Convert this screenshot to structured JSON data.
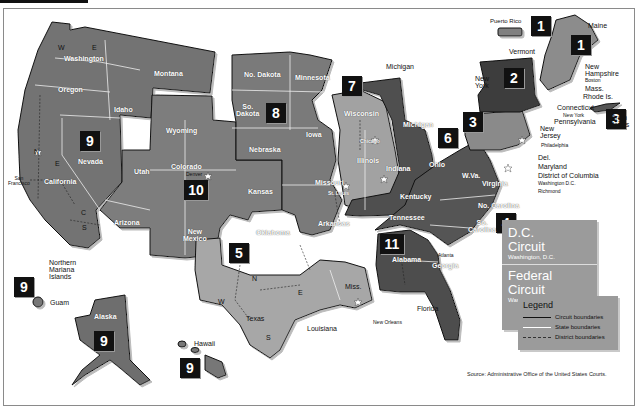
{
  "map": {
    "title": "Geographic Boundaries of United States Courts of Appeals and United States District Courts",
    "source": "Source: Administrative Office of the United States Courts.",
    "colors": {
      "circuit_dark": "#4a4a4a",
      "circuit_medium": "#767676",
      "circuit_light": "#a8a8a8",
      "boundary": "#111111",
      "badge_bg": "#111111",
      "badge_text": "#ffffff",
      "info_box": "#9b9b9b"
    },
    "circuits": [
      {
        "number": "1",
        "states": [
          "Maine",
          "New Hampshire",
          "Mass.",
          "Rhode Is.",
          "Puerto Rico"
        ]
      },
      {
        "number": "2",
        "states": [
          "Vermont",
          "New York",
          "Connecticut"
        ]
      },
      {
        "number": "3",
        "states": [
          "Pennsylvania",
          "New Jersey",
          "Del.",
          "Virgin Islands"
        ]
      },
      {
        "number": "4",
        "states": [
          "Maryland",
          "W.Va.",
          "Virginia",
          "No. Carolina",
          "So. Carolina"
        ]
      },
      {
        "number": "5",
        "states": [
          "Texas",
          "Louisiana",
          "Miss."
        ]
      },
      {
        "number": "6",
        "states": [
          "Michigan",
          "Ohio",
          "Kentucky",
          "Tennessee"
        ]
      },
      {
        "number": "7",
        "states": [
          "Wisconsin",
          "Illinois",
          "Indiana"
        ]
      },
      {
        "number": "8",
        "states": [
          "No. Dakota",
          "So. Dakota",
          "Minnesota",
          "Nebraska",
          "Iowa",
          "Missouri",
          "Arkansas"
        ]
      },
      {
        "number": "9",
        "states": [
          "Washington",
          "Oregon",
          "Idaho",
          "Montana",
          "Nevada",
          "California",
          "Arizona",
          "Alaska",
          "Hawaii",
          "Guam",
          "Northern Mariana Islands"
        ]
      },
      {
        "number": "10",
        "states": [
          "Wyoming",
          "Utah",
          "Colorado",
          "Kansas",
          "New Mexico",
          "Oklahoma"
        ]
      },
      {
        "number": "11",
        "states": [
          "Alabama",
          "Georgia",
          "Florida"
        ]
      }
    ],
    "badges": [
      {
        "id": "b1a",
        "label": "1"
      },
      {
        "id": "b1b",
        "label": "1"
      },
      {
        "id": "b2",
        "label": "2"
      },
      {
        "id": "b3a",
        "label": "3"
      },
      {
        "id": "b3b",
        "label": "3"
      },
      {
        "id": "b4",
        "label": "4"
      },
      {
        "id": "b5",
        "label": "5"
      },
      {
        "id": "b6",
        "label": "6"
      },
      {
        "id": "b7",
        "label": "7"
      },
      {
        "id": "b8",
        "label": "8"
      },
      {
        "id": "b9a",
        "label": "9"
      },
      {
        "id": "b9b",
        "label": "9"
      },
      {
        "id": "b9c",
        "label": "9"
      },
      {
        "id": "b9d",
        "label": "9"
      },
      {
        "id": "b10",
        "label": "10"
      },
      {
        "id": "b11",
        "label": "11"
      }
    ],
    "state_labels": {
      "washington": "Washington",
      "oregon": "Oregon",
      "idaho": "Idaho",
      "montana": "Montana",
      "wyoming": "Wyoming",
      "nevada": "Nevada",
      "california": "California",
      "utah": "Utah",
      "colorado": "Colorado",
      "arizona": "Arizona",
      "new_mexico": "New\nMexico",
      "kansas": "Kansas",
      "oklahoma": "Oklahoma",
      "texas": "Texas",
      "louisiana": "Louisiana",
      "miss": "Miss.",
      "no_dakota": "No. Dakota",
      "so_dakota": "So.\nDakota",
      "minnesota": "Minnesota",
      "nebraska": "Nebraska",
      "iowa": "Iowa",
      "missouri": "Missouri",
      "arkansas": "Arkansas",
      "wisconsin": "Wisconsin",
      "illinois": "Illinois",
      "indiana": "Indiana",
      "michigan": "Michigan",
      "michigan_up": "Michigan",
      "ohio": "Ohio",
      "kentucky": "Kentucky",
      "tennessee": "Tennessee",
      "alabama": "Alabama",
      "georgia": "Georgia",
      "florida": "Florida",
      "wva": "W.Va.",
      "virginia": "Virginia",
      "no_carolina": "No. Carolina",
      "so_carolina": "So.\nCarolina",
      "pennsylvania": "Pennsylvania",
      "new_jersey": "New\nJersey",
      "del": "Del.",
      "maryland": "Maryland",
      "dc": "District of Columbia",
      "new_york": "New\nYork",
      "vermont": "Vermont",
      "connecticut": "Connecticut",
      "maine": "Maine",
      "new_hampshire": "New\nHampshire",
      "mass": "Mass.",
      "rhode_is": "Rhode Is.",
      "puerto_rico": "Puerto Rico",
      "virgin_islands": "Virgin\nIslands",
      "alaska": "Alaska",
      "hawaii": "Hawaii",
      "guam": "Guam",
      "northern_mariana": "Northern\nMariana\nIslands"
    },
    "cities": {
      "san_francisco": "San\nFrancisco",
      "denver": "Denver",
      "st_louis": "St. Louis",
      "chicago": "Chicago",
      "new_orleans": "New Orleans",
      "atlanta": "Atlanta",
      "boston": "Boston",
      "new_york": "New York",
      "philadelphia": "Philadelphia",
      "washington_dc": "Washington D.C.",
      "richmond": "Richmond"
    },
    "district_markers": [
      "N",
      "S",
      "E",
      "W",
      "C",
      "M"
    ],
    "dc_circuit": {
      "title_line1": "D.C.",
      "title_line2": "Circuit",
      "subtitle": "Washington, D.C."
    },
    "federal_circuit": {
      "title_line1": "Federal",
      "title_line2": "Circuit",
      "subtitle": "Washington, D.C."
    },
    "legend": {
      "title": "Legend",
      "items": [
        {
          "label": "Circuit boundaries",
          "style": "solid-dark"
        },
        {
          "label": "State boundaries",
          "style": "solid-white"
        },
        {
          "label": "District boundaries",
          "style": "dashed"
        }
      ]
    }
  }
}
